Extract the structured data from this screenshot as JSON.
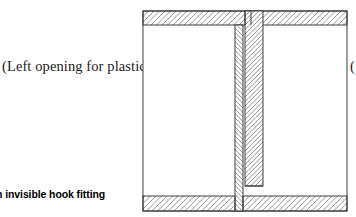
{
  "page": {
    "background_color": "#ffffff",
    "width": 356,
    "height": 217
  },
  "labels": {
    "left_opening": "(Left opening for plastic)",
    "right_opening_clipped": "(",
    "caption": "am of an invisible hook fitting"
  },
  "diagram": {
    "title_semantic": "cross-section-of-invisible-hook-fitting",
    "line_color": "#2b2b2b",
    "hatch_color": "#6f6f6f",
    "fill_color": "#ffffff",
    "frame": {
      "x": 143,
      "y": 11,
      "width": 204,
      "height": 200
    },
    "top_bar": {
      "x": 143,
      "y": 11,
      "width": 204,
      "height": 14,
      "hatch": "diagonal-up-right"
    },
    "bottom_bar": {
      "x": 143,
      "y": 196,
      "width": 204,
      "height": 15,
      "hatch": "diagonal-up-right"
    },
    "center_narrow_strip": {
      "x": 235,
      "y": 25,
      "width": 8,
      "height": 186,
      "hatch": "chevron-left"
    },
    "center_wide_strip": {
      "x": 245,
      "y": 11,
      "width": 18,
      "height": 175,
      "hatch": "chevron-right"
    },
    "hook_step": {
      "x": 245,
      "y": 186,
      "width": 18,
      "height": 10
    },
    "interior_fill": "#ffffff"
  }
}
